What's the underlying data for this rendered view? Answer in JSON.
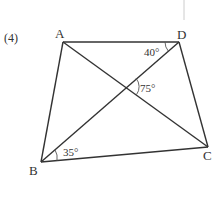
{
  "problem": {
    "number_label": "(4)"
  },
  "points": {
    "A": {
      "label": "A",
      "x": 63,
      "y": 42
    },
    "D": {
      "label": "D",
      "x": 179,
      "y": 42
    },
    "B": {
      "label": "B",
      "x": 41,
      "y": 162
    },
    "C": {
      "label": "C",
      "x": 208,
      "y": 147
    },
    "O": {
      "label": "",
      "x": 126,
      "y": 87
    }
  },
  "segments": [
    "AD",
    "AB",
    "DC",
    "BC",
    "AC",
    "BD"
  ],
  "angles": {
    "ADB": {
      "label": "40°"
    },
    "DOC": {
      "label": "75°"
    },
    "DBC": {
      "label": "35°"
    }
  },
  "colors": {
    "stroke": "#333333",
    "text": "#333333",
    "margin_line": "#cccccc"
  }
}
